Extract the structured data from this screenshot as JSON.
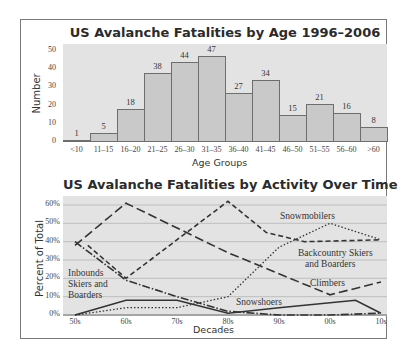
{
  "chart_data": [
    {
      "type": "bar",
      "title": "US Avalanche Fatalities by Age 1996–2006",
      "xlabel": "Age Groups",
      "ylabel": "Number",
      "categories": [
        "<10",
        "11–15",
        "16–20",
        "21–25",
        "26–30",
        "31–35",
        "36–40",
        "41–45",
        "46–50",
        "51–55",
        "56–60",
        ">60"
      ],
      "values": [
        1,
        5,
        18,
        38,
        44,
        47,
        27,
        34,
        15,
        21,
        16,
        8
      ],
      "yticks": [
        "0",
        "10",
        "20",
        "30",
        "40",
        "50"
      ],
      "ylim": [
        0,
        52
      ],
      "grid": false,
      "colors": {
        "plot_bg": "#e3e3e3",
        "bar_fill": "#c9c9c9",
        "bar_edge": "#6e6e6e"
      }
    },
    {
      "type": "line",
      "title": "US Avalanche Fatalities by Activity Over Time",
      "xlabel": "Decades",
      "ylabel": "Percent of Total",
      "categories": [
        "50s",
        "60s",
        "70s",
        "80s",
        "90s",
        "00s",
        "10s"
      ],
      "yticks": [
        "0%",
        "10%",
        "20%",
        "30%",
        "40%",
        "50%",
        "60%"
      ],
      "ylim": [
        0,
        65
      ],
      "grid": true,
      "series": [
        {
          "name": "Climbers",
          "style": "long-dash",
          "x": [
            0,
            1,
            3,
            5,
            6
          ],
          "values": [
            38,
            61,
            34,
            11,
            18
          ]
        },
        {
          "name": "Backcountry Skiers and Boarders",
          "style": "dashed",
          "x": [
            0.25,
            1,
            3,
            3.75,
            4.5,
            6
          ],
          "values": [
            38,
            20,
            62,
            45,
            40,
            41
          ]
        },
        {
          "name": "Snowmobilers",
          "style": "dotted",
          "x": [
            0,
            1,
            2,
            3,
            4,
            5,
            6
          ],
          "values": [
            0,
            4,
            4,
            10,
            37,
            50,
            41
          ]
        },
        {
          "name": "Inbounds Skiers and Boarders",
          "style": "dash-dot",
          "x": [
            0,
            1,
            2,
            3,
            4,
            5,
            6
          ],
          "values": [
            40,
            19,
            10,
            2,
            0,
            0,
            1
          ]
        },
        {
          "name": "Snowshoers",
          "style": "solid",
          "x": [
            0,
            1,
            2,
            3,
            4,
            5.5,
            6
          ],
          "values": [
            0,
            8,
            8,
            1,
            4,
            8,
            1
          ]
        }
      ],
      "annotations": [
        "Snowmobilers",
        "Backcountry Skiers and Boarders",
        "Climbers",
        "Inbounds Skiers and Boarders",
        "Snowshoers"
      ]
    }
  ],
  "labels": {
    "bar_title": "US Avalanche Fatalities by Age 1996–2006",
    "bar_xlabel": "Age Groups",
    "bar_ylabel": "Number",
    "line_title": "US Avalanche Fatalities by Activity Over Time",
    "line_xlabel": "Decades",
    "line_ylabel": "Percent of Total",
    "snowmobilers": "Snowmobilers",
    "backcountry_1": "Backcountry Skiers",
    "backcountry_2": "and Boarders",
    "climbers": "Climbers",
    "inbounds_1": "Inbounds",
    "inbounds_2": "Skiers and",
    "inbounds_3": "Boarders",
    "snowshoers": "Snowshoers"
  }
}
